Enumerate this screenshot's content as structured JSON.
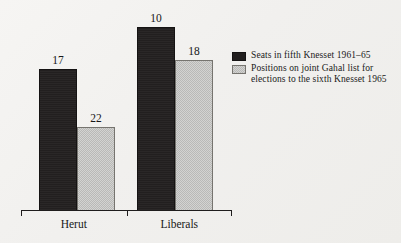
{
  "chart_data": {
    "type": "bar",
    "title": "",
    "subtitle": "",
    "xlabel": "",
    "ylabel": "",
    "ylim": [
      0,
      24
    ],
    "grid": false,
    "legend_position": "right",
    "categories": [
      "Herut",
      "Liberals"
    ],
    "series": [
      {
        "name": "Seats in fifth Knesset 1961–65",
        "color": "#221f1f",
        "values": [
          17,
          22
        ]
      },
      {
        "name": "Positions on joint Gahal list for elections to the sixth Knesset 1965",
        "color": "#c6c6c4",
        "values": [
          10,
          18
        ]
      }
    ],
    "value_labels": {
      "herut_dark": "17",
      "herut_light": "22",
      "liberals_dark": "10",
      "liberals_light": "18"
    }
  },
  "legend": {
    "entries": [
      {
        "swatch": "dark-swatch",
        "line1": "Seats in fifth Knesset 1961–65",
        "line2": ""
      },
      {
        "swatch": "light-swatch",
        "line1": "Positions on joint Gahal list for",
        "line2": "elections to the sixth Knesset 1965"
      }
    ]
  },
  "axis": {
    "categories": [
      "Herut",
      "Liberals"
    ]
  },
  "colors": {
    "background": "#f2f1ef",
    "dark_bar": "#221f1f",
    "light_bar": "#c6c6c4",
    "axis_line": "#1f1d1d",
    "text": "#1a1a1a"
  }
}
